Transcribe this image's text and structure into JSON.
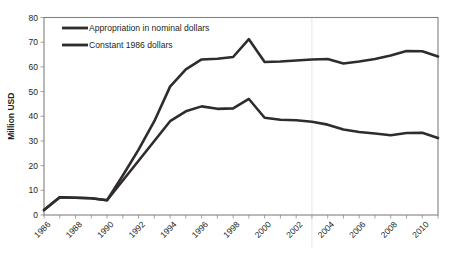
{
  "chart_data": {
    "type": "line",
    "title": "",
    "xlabel": "",
    "ylabel": "Million USD",
    "ylim": [
      0,
      80
    ],
    "ytick_values": [
      0,
      10,
      20,
      30,
      40,
      50,
      60,
      70,
      80
    ],
    "ytick_labels": [
      "0",
      "10",
      "20",
      "30",
      "40",
      "50",
      "60",
      "70",
      "80"
    ],
    "xlim": [
      1986,
      2011
    ],
    "x": [
      1986,
      1987,
      1988,
      1989,
      1990,
      1991,
      1992,
      1993,
      1994,
      1995,
      1996,
      1997,
      1998,
      1999,
      2000,
      2001,
      2002,
      2003,
      2004,
      2005,
      2006,
      2007,
      2008,
      2009,
      2010,
      2011
    ],
    "xtick_labels": [
      "1986",
      "1988",
      "1990",
      "1992",
      "1994",
      "1996",
      "1998",
      "2000",
      "2002",
      "2004",
      "2006",
      "2008",
      "2010"
    ],
    "xtick_values": [
      1986,
      1988,
      1990,
      1992,
      1994,
      1996,
      1998,
      2000,
      2002,
      2004,
      2006,
      2008,
      2010
    ],
    "grid": false,
    "legend_position": "upper-left",
    "series": [
      {
        "name": "Appropriation in nominal dollars",
        "color": "#2f2c2b",
        "values": [
          2.0,
          7.2,
          7.0,
          6.8,
          6.0,
          16.0,
          26.5,
          38.0,
          52.0,
          59.0,
          63.0,
          63.3,
          64.0,
          71.2,
          62.0,
          62.2,
          62.6,
          63.0,
          63.2,
          61.4,
          62.2,
          63.2,
          64.6,
          66.4,
          66.3,
          64.2
        ]
      },
      {
        "name": "Constant 1986 dollars",
        "color": "#2f2c2b",
        "values": [
          2.0,
          7.2,
          7.0,
          6.8,
          6.0,
          14.0,
          22.0,
          30.0,
          38.0,
          42.0,
          44.0,
          43.0,
          43.2,
          47.0,
          39.4,
          38.6,
          38.4,
          37.8,
          36.6,
          34.6,
          33.6,
          33.0,
          32.3,
          33.2,
          33.3,
          31.2
        ]
      }
    ],
    "legend": [
      {
        "label": "Appropriation in nominal dollars"
      },
      {
        "label": "Constant 1986 dollars"
      }
    ]
  },
  "colors": {
    "line": "#2f2c2b",
    "border": "#808080",
    "text": "#231f20",
    "background": "#ffffff"
  }
}
